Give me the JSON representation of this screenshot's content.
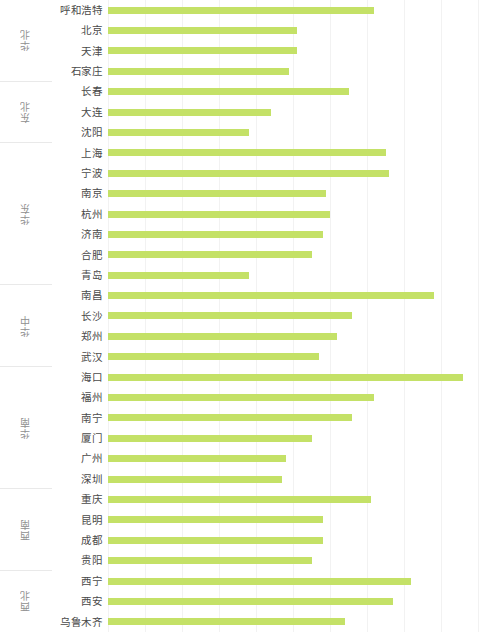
{
  "chart": {
    "title": "",
    "bar_color": "#c4e167",
    "grid_color": "#f2f2f2",
    "label_color": "#4a4a4a",
    "group_label_color": "#8f8f8f"
  },
  "chart_data": {
    "type": "bar",
    "orientation": "horizontal",
    "title": "",
    "xlabel": "",
    "ylabel": "",
    "grid": true,
    "legend": "none",
    "xlim": [
      0,
      100
    ],
    "gridline_values": [
      0,
      10,
      20,
      30,
      40,
      50,
      60,
      70,
      80,
      90,
      100
    ],
    "categories": [
      "呼和浩特",
      "北京",
      "天津",
      "石家庄",
      "长春",
      "大连",
      "沈阳",
      "上海",
      "宁波",
      "南京",
      "杭州",
      "济南",
      "合肥",
      "青岛",
      "南昌",
      "长沙",
      "郑州",
      "武汉",
      "海口",
      "福州",
      "南宁",
      "厦门",
      "广州",
      "深圳",
      "重庆",
      "昆明",
      "成都",
      "贵阳",
      "西宁",
      "西安",
      "乌鲁木齐"
    ],
    "values": [
      72,
      51,
      51,
      49,
      65,
      44,
      38,
      75,
      76,
      59,
      60,
      58,
      55,
      38,
      88,
      66,
      62,
      57,
      96,
      72,
      66,
      55,
      48,
      47,
      71,
      58,
      58,
      55,
      82,
      77,
      64
    ],
    "groups": [
      {
        "label": "华北",
        "cities": [
          "呼和浩特",
          "北京",
          "天津",
          "石家庄"
        ]
      },
      {
        "label": "东北",
        "cities": [
          "长春",
          "大连",
          "沈阳"
        ]
      },
      {
        "label": "华东",
        "cities": [
          "上海",
          "宁波",
          "南京",
          "杭州",
          "济南",
          "合肥",
          "青岛"
        ]
      },
      {
        "label": "华中",
        "cities": [
          "南昌",
          "长沙",
          "郑州",
          "武汉"
        ]
      },
      {
        "label": "华南",
        "cities": [
          "海口",
          "福州",
          "南宁",
          "厦门",
          "广州",
          "深圳"
        ]
      },
      {
        "label": "西南",
        "cities": [
          "重庆",
          "昆明",
          "成都",
          "贵阳"
        ]
      },
      {
        "label": "西北",
        "cities": [
          "西宁",
          "西安",
          "乌鲁木齐"
        ]
      }
    ]
  }
}
